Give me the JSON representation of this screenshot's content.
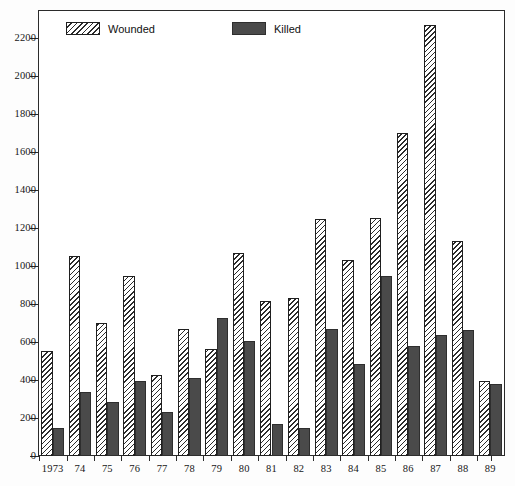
{
  "chart_data": {
    "type": "bar",
    "title": "",
    "subtitle": "",
    "xlabel": "",
    "ylabel": "",
    "grid": false,
    "legend_position": "top-inside",
    "ylim": [
      0,
      2320
    ],
    "ytick_step": 200,
    "yticks": [
      0,
      200,
      400,
      600,
      800,
      1000,
      1200,
      1400,
      1600,
      1800,
      2000,
      2200
    ],
    "ytick_labels": [
      "0",
      "200",
      "400",
      "600",
      "800",
      "1000",
      "1200",
      "1400",
      "1600",
      "1800",
      "2000",
      "2200"
    ],
    "categories": [
      "1973",
      "74",
      "75",
      "76",
      "77",
      "78",
      "79",
      "80",
      "81",
      "82",
      "83",
      "84",
      "85",
      "86",
      "87",
      "88",
      "89"
    ],
    "series": [
      {
        "name": "Wounded",
        "color": "#ffffff",
        "pattern": "diagonal-hatch",
        "values": [
          555,
          1055,
          700,
          945,
          425,
          670,
          565,
          1070,
          815,
          830,
          1250,
          1030,
          1255,
          1700,
          2270,
          1130,
          395
        ]
      },
      {
        "name": "Killed",
        "color": "#4a4a4a",
        "pattern": "solid",
        "values": [
          150,
          335,
          285,
          395,
          230,
          410,
          725,
          605,
          170,
          150,
          670,
          485,
          945,
          580,
          635,
          665,
          380
        ]
      }
    ]
  },
  "legend": {
    "items": [
      {
        "label": "Wounded",
        "swatch": "hatched-swatch"
      },
      {
        "label": "Killed",
        "swatch": "solid-dark-swatch"
      }
    ]
  },
  "colors": {
    "axis": "#2b2b2b",
    "killed_fill": "#4a4a4a",
    "wounded_fill": "#ffffff",
    "hatch_stroke": "#2b2b2b",
    "background": "#ffffff"
  }
}
